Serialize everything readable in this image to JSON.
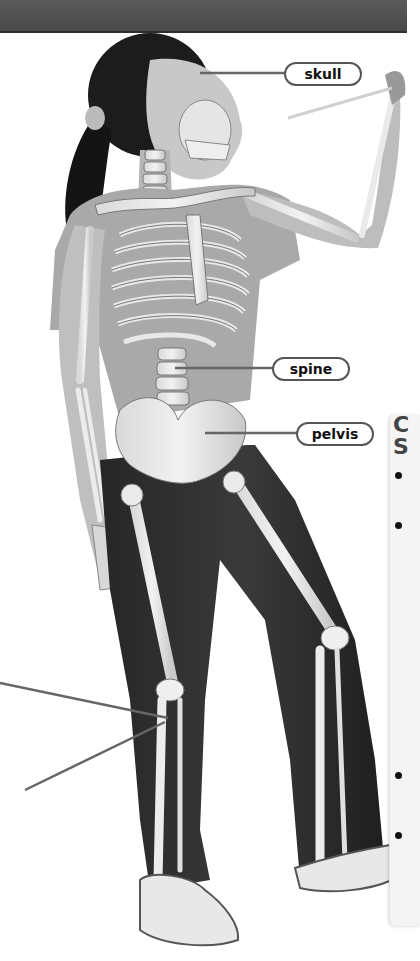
{
  "page": {
    "header_band_color": "#4f4f4f",
    "image_mode": "grayscale"
  },
  "figure": {
    "labels": [
      {
        "id": "skull",
        "text": "skull"
      },
      {
        "id": "spine",
        "text": "spine"
      },
      {
        "id": "pelvis",
        "text": "pelvis"
      }
    ],
    "unlabeled_leaders": [
      {
        "target": "knee",
        "note": "label cut off at left edge"
      },
      {
        "target": "knee",
        "note": "label cut off at left edge"
      }
    ]
  },
  "side_panel": {
    "heading_line1": "C",
    "heading_line2": "S",
    "bullets": [
      "•",
      "•",
      "•",
      "•"
    ]
  }
}
